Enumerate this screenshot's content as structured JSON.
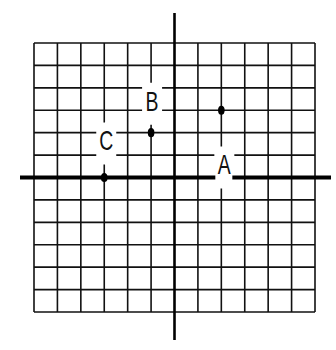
{
  "diagram": {
    "type": "coordinate-grid",
    "grid": {
      "columns": 12,
      "rows": 12,
      "x_range": [
        -6,
        6
      ],
      "y_range": [
        -6,
        6
      ]
    },
    "colors": {
      "line": "#111111",
      "background": "#ffffff"
    },
    "points": [
      {
        "label": "A",
        "x": 2,
        "y": 3
      },
      {
        "label": "B",
        "x": -1,
        "y": 2
      },
      {
        "label": "C",
        "x": -3,
        "y": 0
      }
    ]
  },
  "chart_data": {
    "type": "scatter",
    "title": "",
    "xlabel": "",
    "ylabel": "",
    "x_range": [
      -6,
      6
    ],
    "y_range": [
      -6,
      6
    ],
    "grid": true,
    "series": [
      {
        "name": "points",
        "labels": [
          "A",
          "B",
          "C"
        ],
        "x": [
          2,
          -1,
          -3
        ],
        "y": [
          3,
          2,
          0
        ]
      }
    ]
  }
}
